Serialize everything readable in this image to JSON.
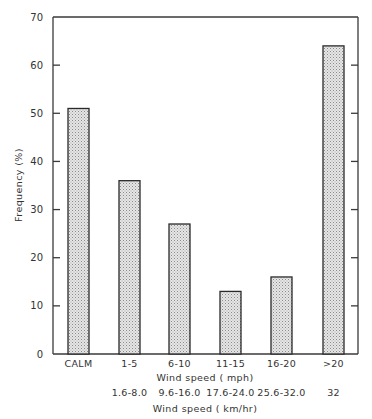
{
  "chart_data": {
    "type": "bar",
    "title": "",
    "categories": [
      "CALM",
      "1-5",
      "6-10",
      "11-15",
      "16-20",
      ">20"
    ],
    "secondary_categories": [
      "",
      "1.6-8.0",
      "9.6-16.0",
      "17.6-24.0",
      "25.6-32.0",
      "32"
    ],
    "values": [
      51,
      36,
      27,
      13,
      16,
      64
    ],
    "xlabel": "Wind speed (mph)",
    "xlabel_secondary": "Wind speed (km/hr)",
    "ylabel": "Frequency (%)",
    "ylim": [
      0,
      70
    ],
    "yticks": [
      0,
      10,
      20,
      30,
      40,
      50,
      60,
      70
    ],
    "grid": false,
    "legend": null,
    "bar_fill": "stippled light gray",
    "colors": {
      "bar_fill": "#d9d9d9",
      "bar_edge": "#2a2a2a",
      "axis": "#3a3a3a"
    }
  },
  "labels": {
    "xlabel": "Wind speed ( mph)",
    "xlabel_secondary": "Wind speed ( km/hr)",
    "ylabel": "Frequency (%)",
    "yticks": [
      "0",
      "10",
      "20",
      "30",
      "40",
      "50",
      "60",
      "70"
    ],
    "categories": [
      "CALM",
      "1-5",
      "6-10",
      "11-15",
      "16-20",
      ">20"
    ],
    "secondary_categories": [
      "1.6-8.0",
      "9.6-16.0",
      "17.6-24.0",
      "25.6-32.0",
      "32"
    ]
  }
}
